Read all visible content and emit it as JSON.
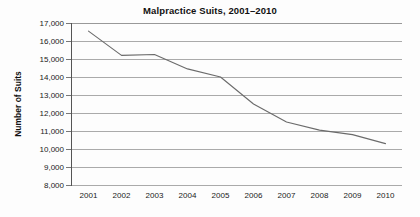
{
  "chart_data": {
    "type": "line",
    "title": "Malpractice Suits, 2001–2010",
    "xlabel": "",
    "ylabel": "Number of Suits",
    "categories": [
      "2001",
      "2002",
      "2003",
      "2004",
      "2005",
      "2006",
      "2007",
      "2008",
      "2009",
      "2010"
    ],
    "x": [
      2001,
      2002,
      2003,
      2004,
      2005,
      2006,
      2007,
      2008,
      2009,
      2010
    ],
    "values": [
      16550,
      15200,
      15250,
      14450,
      14000,
      12500,
      11500,
      11050,
      10800,
      10300
    ],
    "series": [
      {
        "name": "Number of Suits",
        "values": [
          16550,
          15200,
          15250,
          14450,
          14000,
          12500,
          11500,
          11050,
          10800,
          10300
        ]
      }
    ],
    "ylim": [
      8000,
      17000
    ],
    "ytick_values": [
      17000,
      16000,
      15000,
      14000,
      13000,
      12000,
      11000,
      10000,
      9000,
      8000
    ],
    "ytick_labels": [
      "17,000",
      "16,000",
      "15,000",
      "14,000",
      "13,000",
      "12,000",
      "11,000",
      "10,000",
      "9,000",
      "8,000"
    ],
    "xtick_labels": [
      "2001",
      "2002",
      "2003",
      "2004",
      "2005",
      "2006",
      "2007",
      "2008",
      "2009",
      "2010"
    ],
    "grid": true,
    "legend": false,
    "legend_position": "none",
    "line_color": "#6b6b6b",
    "grid_color": "#aaaaaa",
    "axis_color": "#555555",
    "background_color": "#fdfdfd",
    "text_color": "#111111",
    "markers": false
  }
}
